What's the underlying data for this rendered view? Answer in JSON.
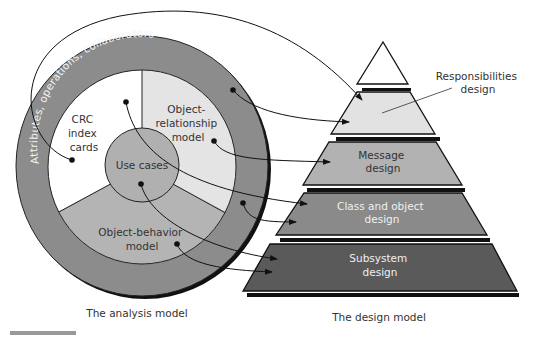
{
  "analysis_model": {
    "caption": "The analysis model",
    "ring_label": "Attributes, operations, collaborators",
    "sections": {
      "crc": [
        "CRC",
        "index",
        "cards"
      ],
      "object_relationship": [
        "Object-",
        "relationship",
        "model"
      ],
      "object_behavior": [
        "Object-behavior",
        "model"
      ],
      "use_cases": "Use cases"
    },
    "colors": {
      "outer_ring": "#8c8c8c",
      "crc": "#ffffff",
      "object_relationship": "#e4e4e4",
      "object_behavior": "#b4b4b4",
      "use_cases": "#b0b0b0"
    }
  },
  "design_model": {
    "caption": "The design model",
    "callout": [
      "Responsibilities",
      "design"
    ],
    "layers": [
      {
        "name": "Top (apex)",
        "label": [],
        "color": "#ffffff"
      },
      {
        "name": "Responsibilities design",
        "label": [],
        "color": "#e2e2e2"
      },
      {
        "name": "Message design",
        "label": [
          "Message",
          "design"
        ],
        "color": "#b2b2b2"
      },
      {
        "name": "Class and object design",
        "label": [
          "Class and object",
          "design"
        ],
        "color": "#8a8a8a"
      },
      {
        "name": "Subsystem design",
        "label": [
          "Subsystem",
          "design"
        ],
        "color": "#5a5a5a"
      }
    ]
  },
  "mappings": [
    {
      "from": "CRC index cards",
      "to": "Responsibilities design"
    },
    {
      "from": "Attributes, operations, collaborators",
      "to": "Responsibilities design"
    },
    {
      "from": "Object-relationship model",
      "to": "Message design"
    },
    {
      "from": "Use cases",
      "to": "Class and object design"
    },
    {
      "from": "Attributes, operations, collaborators",
      "to": "Class and object design"
    },
    {
      "from": "Use cases",
      "to": "Subsystem design"
    },
    {
      "from": "Object-behavior model",
      "to": "Subsystem design"
    }
  ],
  "figure_fragment": "FIGURE"
}
